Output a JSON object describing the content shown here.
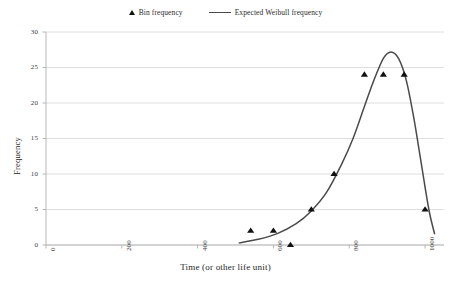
{
  "legend": {
    "items": [
      {
        "label": "Bin frequency",
        "marker": "triangle-marker-icon"
      },
      {
        "label": "Expected Weibull frequency",
        "marker": "line-marker-icon"
      }
    ]
  },
  "chart_data": {
    "type": "scatter",
    "title": "",
    "xlabel": "Time (or other life unit)",
    "ylabel": "Frequency",
    "xlim": [
      0,
      1050
    ],
    "ylim": [
      0,
      30
    ],
    "xticks": [
      0,
      200,
      400,
      600,
      800,
      1000
    ],
    "yticks": [
      0,
      5,
      10,
      15,
      20,
      25,
      30
    ],
    "grid": "horizontal",
    "legend_position": "top-center",
    "series": [
      {
        "name": "Bin frequency",
        "type": "scatter",
        "marker": "triangle",
        "color": "#111111",
        "x": [
          540,
          600,
          645,
          700,
          760,
          840,
          890,
          945,
          1000
        ],
        "y": [
          2,
          2,
          0,
          5,
          10,
          24,
          24,
          24,
          5
        ]
      },
      {
        "name": "Expected Weibull frequency",
        "type": "line",
        "color": "#4a4a4a",
        "x": [
          510,
          560,
          610,
          660,
          700,
          740,
          780,
          810,
          840,
          865,
          890,
          910,
          930,
          950,
          970,
          990,
          1010,
          1025
        ],
        "y": [
          0.3,
          0.8,
          1.6,
          3.0,
          4.8,
          7.4,
          11.4,
          15.0,
          19.5,
          23.2,
          26.3,
          27.2,
          26.3,
          23.3,
          18.0,
          11.5,
          5.0,
          1.6
        ]
      }
    ]
  }
}
